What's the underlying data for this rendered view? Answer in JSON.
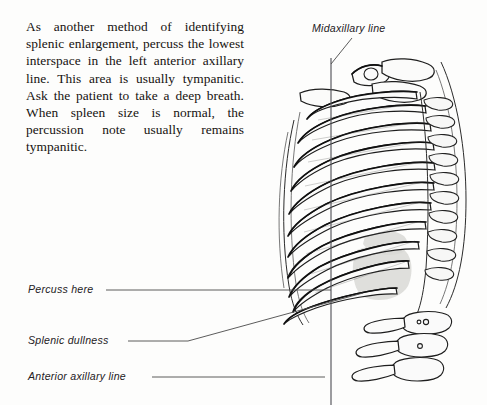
{
  "figure": {
    "kind": "medical-illustration",
    "background_color": "#fdfdfc",
    "ink_color": "#1a1a1a"
  },
  "body_text": {
    "paragraph": "As another method of identifying splenic enlargement, percuss the lowest interspace in the left anterior axillary line. This area is usually tympanitic. Ask the patient to take a deep breath. When spleen size is normal, the percussion note usually remains tympanitic."
  },
  "labels": {
    "midaxillary": "Midaxillary line",
    "percuss_here": "Percuss here",
    "splenic_dullness": "Splenic dullness",
    "anterior_axillary": "Anterior axillary line"
  },
  "annotation_lines": {
    "midaxillary_leader": "diagonal from label down-right to top of vertical line",
    "percuss_leader": "horizontal from label right to lowest interspace",
    "splenic_leader": "horizontal then angled up-right to shaded dullness area",
    "axillary_leader": "horizontal from label right to vertical line",
    "vertical_reference_line": "midaxillary / anterior axillary vertical line"
  },
  "anatomy": {
    "ribs_count": 11,
    "lumbar_vertebrae_count": 3,
    "shaded_region": "splenic dullness",
    "shade_color": "#d9d9d6"
  }
}
